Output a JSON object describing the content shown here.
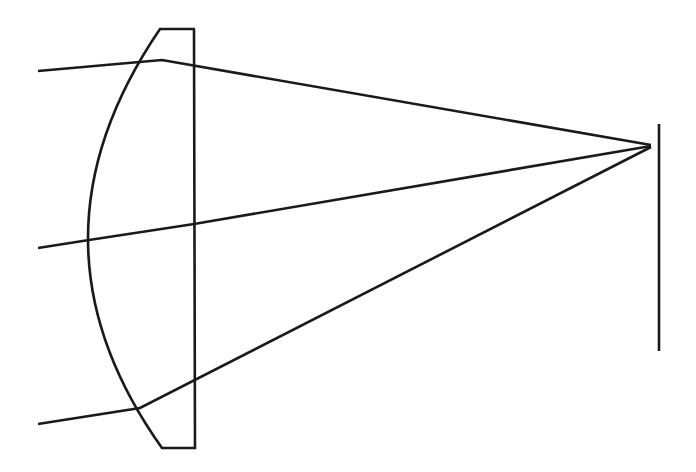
{
  "figure": {
    "domain": "Diagram",
    "canvas": {
      "width": 696,
      "height": 472,
      "background": "#ffffff"
    },
    "stroke_color": "#1a1a1a",
    "stroke_width": 2.6
  },
  "chart_data": {
    "type": "line",
    "xlabel": "",
    "ylabel": "",
    "xlim": [
      0,
      696
    ],
    "ylim": [
      0,
      472
    ],
    "grid": false,
    "legend": null,
    "elements": {
      "lens": {
        "name": "plano-convex-lens",
        "curved_surface_side": "left",
        "flat_surface_side": "right",
        "flat_edge_x": 194,
        "top_y": 29,
        "bottom_y": 448,
        "top_flat_x_start": 160,
        "top_flat_x_end": 195,
        "bottom_flat_x_start": 162,
        "bottom_flat_x_end": 195,
        "curve_apex_x": 88,
        "curve_apex_y": 240,
        "curve_top_point": [
          160,
          29
        ],
        "curve_bottom_point": [
          162,
          448
        ]
      },
      "screen": {
        "name": "image-screen",
        "x": 659,
        "y_top": 124,
        "y_bottom": 351
      },
      "focus_point": {
        "x": 651,
        "y": 145
      }
    },
    "series": [
      {
        "name": "ray-top",
        "points": [
          [
            38,
            71
          ],
          [
            162,
            60
          ],
          [
            651,
            145
          ]
        ]
      },
      {
        "name": "ray-middle",
        "points": [
          [
            38,
            248
          ],
          [
            89,
            240
          ],
          [
            194,
            224
          ],
          [
            651,
            146
          ]
        ]
      },
      {
        "name": "ray-bottom",
        "points": [
          [
            38,
            424
          ],
          [
            140,
            408
          ],
          [
            651,
            147
          ]
        ]
      }
    ]
  }
}
